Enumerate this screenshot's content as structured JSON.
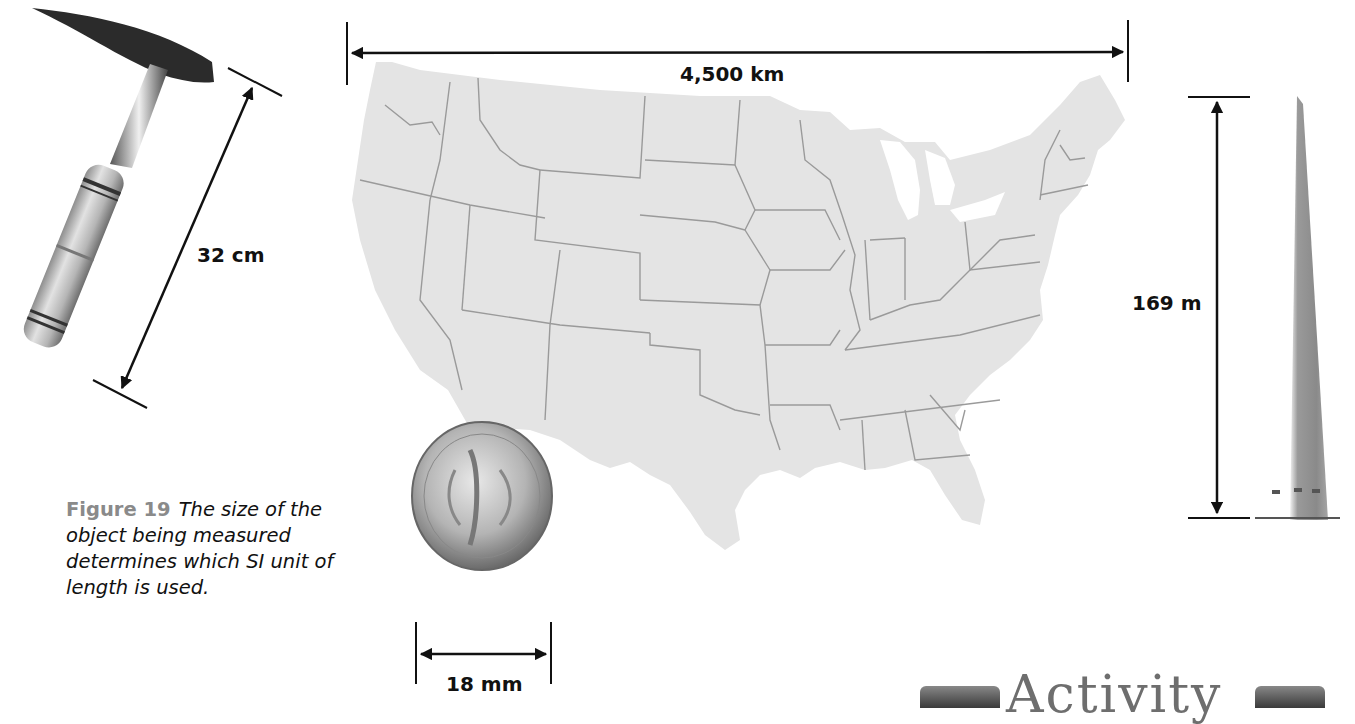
{
  "figure": {
    "label": "Figure 19",
    "caption": "The size of the object being measured determines which SI unit of length is used."
  },
  "measurements": {
    "hammer": {
      "object": "rock hammer",
      "value": "32 cm",
      "unit": "centimeter"
    },
    "usa_map": {
      "object": "continental United States",
      "value": "4,500 km",
      "unit": "kilometer"
    },
    "monument": {
      "object": "Washington Monument",
      "value": "169 m",
      "unit": "meter"
    },
    "dime": {
      "object": "dime",
      "value": "18 mm",
      "unit": "millimeter"
    }
  },
  "dime_inscriptions": {
    "top": "UNITED STATES OF AMERICA",
    "bottom": "ONE DIME",
    "motto": "E PLURIBUS UNUM"
  },
  "activity_banner": {
    "title": "Activity"
  },
  "colors": {
    "figure_label": "#8a8a8a",
    "map_fill": "#e4e4e4",
    "map_borders": "#9a9a9a",
    "arrows": "#111111"
  }
}
